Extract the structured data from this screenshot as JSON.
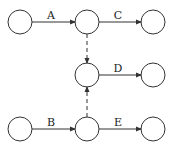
{
  "diagram": {
    "type": "activity-on-arrow network",
    "nodes": [
      {
        "id": "n1",
        "x": 20,
        "y": 22
      },
      {
        "id": "n2",
        "x": 87,
        "y": 22
      },
      {
        "id": "n3",
        "x": 153,
        "y": 22
      },
      {
        "id": "n4",
        "x": 87,
        "y": 75
      },
      {
        "id": "n5",
        "x": 153,
        "y": 75
      },
      {
        "id": "n6",
        "x": 20,
        "y": 129
      },
      {
        "id": "n7",
        "x": 87,
        "y": 129
      },
      {
        "id": "n8",
        "x": 153,
        "y": 129
      }
    ],
    "edges": [
      {
        "label": "A",
        "from": "n1",
        "to": "n2"
      },
      {
        "label": "C",
        "from": "n2",
        "to": "n3"
      },
      {
        "label": "D",
        "from": "n4",
        "to": "n5"
      },
      {
        "label": "B",
        "from": "n6",
        "to": "n7"
      },
      {
        "label": "E",
        "from": "n7",
        "to": "n8"
      },
      {
        "label": "",
        "from": "n2",
        "to": "n4",
        "style": "dashed"
      },
      {
        "label": "",
        "from": "n7",
        "to": "n4",
        "style": "dashed"
      }
    ]
  },
  "labels": {
    "a": "A",
    "b": "B",
    "c": "C",
    "d": "D",
    "e": "E"
  }
}
